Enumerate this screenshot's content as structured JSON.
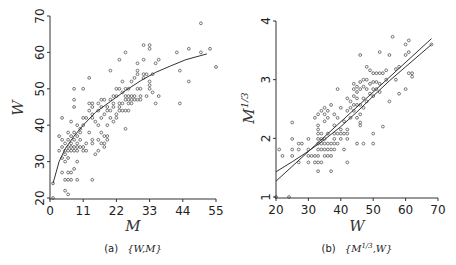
{
  "chart_data": [
    {
      "type": "scatter",
      "panel": "a",
      "caption": "(a) {W,M}",
      "caption_prefix": "(a)",
      "caption_math": "{W,M}",
      "xlabel": "M",
      "ylabel": "W",
      "xlim": [
        0,
        55
      ],
      "ylim": [
        20,
        70
      ],
      "xticks": [
        0,
        11,
        22,
        33,
        44,
        55
      ],
      "yticks": [
        20,
        30,
        40,
        50,
        60,
        70
      ],
      "grid": false,
      "fit_curve": {
        "type": "power",
        "description": "concave increasing fitted curve",
        "points": [
          [
            1,
            24
          ],
          [
            3,
            30
          ],
          [
            5,
            33.5
          ],
          [
            8,
            37
          ],
          [
            11,
            40
          ],
          [
            15,
            43.5
          ],
          [
            20,
            46.5
          ],
          [
            25,
            49.5
          ],
          [
            30,
            52.2
          ],
          [
            35,
            54.5
          ],
          [
            40,
            56.3
          ],
          [
            45,
            58
          ],
          [
            52,
            59.6
          ]
        ]
      },
      "points": [
        [
          1,
          20
        ],
        [
          1,
          24
        ],
        [
          3,
          37
        ],
        [
          3,
          33
        ],
        [
          4,
          42
        ],
        [
          4,
          36
        ],
        [
          4,
          34
        ],
        [
          4,
          31
        ],
        [
          4,
          27
        ],
        [
          5,
          35
        ],
        [
          5,
          33
        ],
        [
          5,
          32
        ],
        [
          5,
          30
        ],
        [
          5,
          25
        ],
        [
          5,
          22
        ],
        [
          6,
          38
        ],
        [
          6,
          36
        ],
        [
          6,
          34
        ],
        [
          6,
          33
        ],
        [
          6,
          31
        ],
        [
          6,
          27
        ],
        [
          6,
          25
        ],
        [
          6,
          21
        ],
        [
          7,
          41
        ],
        [
          7,
          37
        ],
        [
          7,
          35
        ],
        [
          7,
          34
        ],
        [
          7,
          33
        ],
        [
          7,
          27
        ],
        [
          7,
          25
        ],
        [
          8,
          50
        ],
        [
          8,
          47
        ],
        [
          8,
          45
        ],
        [
          8,
          38
        ],
        [
          8,
          36
        ],
        [
          8,
          34
        ],
        [
          8,
          33
        ],
        [
          8,
          28
        ],
        [
          9,
          40
        ],
        [
          9,
          37
        ],
        [
          9,
          35
        ],
        [
          9,
          34
        ],
        [
          9,
          33
        ],
        [
          9,
          30
        ],
        [
          9,
          25
        ],
        [
          10,
          39
        ],
        [
          10,
          38
        ],
        [
          10,
          36
        ],
        [
          10,
          34
        ],
        [
          11,
          50
        ],
        [
          11,
          42
        ],
        [
          11,
          40
        ],
        [
          11,
          34
        ],
        [
          11,
          33
        ],
        [
          12,
          42
        ],
        [
          12,
          35
        ],
        [
          12,
          33
        ],
        [
          13,
          53
        ],
        [
          13,
          46
        ],
        [
          13,
          44
        ],
        [
          13,
          38
        ],
        [
          14,
          46
        ],
        [
          14,
          45
        ],
        [
          14,
          43
        ],
        [
          14,
          42
        ],
        [
          14,
          36
        ],
        [
          14,
          35
        ],
        [
          14,
          25
        ],
        [
          15,
          41
        ],
        [
          15,
          32
        ],
        [
          16,
          46
        ],
        [
          16,
          44
        ],
        [
          16,
          40
        ],
        [
          16,
          36
        ],
        [
          16,
          33
        ],
        [
          17,
          47
        ],
        [
          17,
          45
        ],
        [
          17,
          42
        ],
        [
          17,
          38
        ],
        [
          17,
          35
        ],
        [
          18,
          47
        ],
        [
          18,
          43
        ],
        [
          18,
          37
        ],
        [
          18,
          35
        ],
        [
          18,
          34
        ],
        [
          19,
          45
        ],
        [
          19,
          44
        ],
        [
          19,
          40
        ],
        [
          19,
          37
        ],
        [
          19,
          36
        ],
        [
          20,
          55
        ],
        [
          20,
          47
        ],
        [
          20,
          44
        ],
        [
          20,
          42
        ],
        [
          21,
          48
        ],
        [
          21,
          46
        ],
        [
          21,
          45
        ],
        [
          21,
          41
        ],
        [
          22,
          50
        ],
        [
          22,
          48
        ],
        [
          22,
          43
        ],
        [
          22,
          42
        ],
        [
          23,
          58
        ],
        [
          23,
          50
        ],
        [
          23,
          46
        ],
        [
          23,
          45
        ],
        [
          23,
          44
        ],
        [
          24,
          52
        ],
        [
          24,
          49
        ],
        [
          24,
          46
        ],
        [
          24,
          44
        ],
        [
          25,
          60
        ],
        [
          25,
          50
        ],
        [
          25,
          48
        ],
        [
          25,
          47
        ],
        [
          25,
          44
        ],
        [
          25,
          39
        ],
        [
          26,
          50
        ],
        [
          26,
          48
        ],
        [
          26,
          47
        ],
        [
          26,
          46
        ],
        [
          26,
          44
        ],
        [
          27,
          52
        ],
        [
          27,
          48
        ],
        [
          27,
          47
        ],
        [
          27,
          46
        ],
        [
          28,
          53
        ],
        [
          28,
          48
        ],
        [
          28,
          47
        ],
        [
          29,
          57
        ],
        [
          29,
          55
        ],
        [
          29,
          54
        ],
        [
          29,
          50
        ],
        [
          29,
          47
        ],
        [
          30,
          50
        ],
        [
          30,
          48
        ],
        [
          30,
          47
        ],
        [
          31,
          62
        ],
        [
          31,
          58
        ],
        [
          31,
          54
        ],
        [
          31,
          53
        ],
        [
          32,
          54
        ],
        [
          32,
          48
        ],
        [
          33,
          62
        ],
        [
          33,
          61
        ],
        [
          33,
          52
        ],
        [
          33,
          51
        ],
        [
          33,
          50
        ],
        [
          34,
          54
        ],
        [
          34,
          49
        ],
        [
          35,
          57
        ],
        [
          35,
          46
        ],
        [
          36,
          58
        ],
        [
          36,
          48
        ],
        [
          42,
          60
        ],
        [
          43,
          55
        ],
        [
          43,
          46
        ],
        [
          46,
          61
        ],
        [
          46,
          52
        ],
        [
          50,
          68
        ],
        [
          50,
          60
        ],
        [
          53,
          61
        ],
        [
          55,
          56
        ]
      ]
    },
    {
      "type": "scatter",
      "panel": "b",
      "caption": "(b) {M^1/3,W}",
      "caption_prefix": "(b)",
      "caption_math": "{M",
      "caption_sup": "1/3",
      "caption_math2": ",W}",
      "xlabel": "W",
      "ylabel": "M",
      "ylabel_sup": "1/3",
      "xlim": [
        20,
        70
      ],
      "ylim": [
        1,
        4
      ],
      "xticks": [
        20,
        30,
        40,
        50,
        60,
        70
      ],
      "yticks": [
        1,
        2,
        3,
        4
      ],
      "grid": false,
      "fit_lines": [
        {
          "name": "linear fit",
          "points": [
            [
              20,
              1.27
            ],
            [
              68,
              3.7
            ]
          ]
        },
        {
          "name": "curved fit",
          "points": [
            [
              20,
              1.43
            ],
            [
              25,
              1.6
            ],
            [
              30,
              1.78
            ],
            [
              35,
              1.98
            ],
            [
              40,
              2.2
            ],
            [
              45,
              2.45
            ],
            [
              50,
              2.72
            ],
            [
              55,
              2.98
            ],
            [
              60,
              3.22
            ],
            [
              68,
              3.6
            ]
          ]
        }
      ],
      "points": [
        [
          20,
          1.0
        ],
        [
          24,
          1.0
        ],
        [
          21,
          1.81
        ],
        [
          22,
          1.7
        ],
        [
          25,
          2.27
        ],
        [
          25,
          1.99
        ],
        [
          25,
          1.81
        ],
        [
          25,
          1.7
        ],
        [
          27,
          1.91
        ],
        [
          27,
          1.81
        ],
        [
          27,
          1.59
        ],
        [
          28,
          1.91
        ],
        [
          30,
          1.99
        ],
        [
          30,
          1.81
        ],
        [
          30,
          1.7
        ],
        [
          30,
          1.59
        ],
        [
          31,
          1.7
        ],
        [
          32,
          2.35
        ],
        [
          32,
          1.7
        ],
        [
          32,
          1.59
        ],
        [
          33,
          2.41
        ],
        [
          33,
          2.22
        ],
        [
          33,
          2.15
        ],
        [
          33,
          2.08
        ],
        [
          33,
          1.99
        ],
        [
          33,
          1.91
        ],
        [
          33,
          1.81
        ],
        [
          33,
          1.7
        ],
        [
          33,
          1.59
        ],
        [
          33,
          1.44
        ],
        [
          34,
          2.47
        ],
        [
          34,
          2.08
        ],
        [
          34,
          1.99
        ],
        [
          34,
          1.91
        ],
        [
          34,
          1.81
        ],
        [
          34,
          1.59
        ],
        [
          35,
          2.52
        ],
        [
          35,
          2.41
        ],
        [
          35,
          2.29
        ],
        [
          35,
          1.99
        ],
        [
          35,
          1.91
        ],
        [
          35,
          1.81
        ],
        [
          35,
          1.7
        ],
        [
          36,
          2.47
        ],
        [
          36,
          2.35
        ],
        [
          36,
          2.08
        ],
        [
          36,
          1.91
        ],
        [
          36,
          1.81
        ],
        [
          36,
          1.7
        ],
        [
          37,
          2.57
        ],
        [
          37,
          1.91
        ],
        [
          37,
          1.81
        ],
        [
          37,
          1.7
        ],
        [
          37,
          1.44
        ],
        [
          38,
          2.41
        ],
        [
          38,
          2.22
        ],
        [
          38,
          2.08
        ],
        [
          38,
          1.99
        ],
        [
          38,
          1.91
        ],
        [
          38,
          1.81
        ],
        [
          39,
          2.84
        ],
        [
          39,
          2.35
        ],
        [
          39,
          2.08
        ],
        [
          39,
          1.91
        ],
        [
          40,
          2.52
        ],
        [
          40,
          2.15
        ],
        [
          40,
          2.08
        ],
        [
          40,
          1.99
        ],
        [
          41,
          2.29
        ],
        [
          41,
          2.08
        ],
        [
          41,
          1.81
        ],
        [
          42,
          2.68
        ],
        [
          42,
          2.47
        ],
        [
          42,
          2.15
        ],
        [
          42,
          2.08
        ],
        [
          42,
          1.99
        ],
        [
          42,
          1.59
        ],
        [
          43,
          2.63
        ],
        [
          43,
          2.52
        ],
        [
          43,
          2.35
        ],
        [
          44,
          2.93
        ],
        [
          44,
          2.84
        ],
        [
          44,
          2.72
        ],
        [
          44,
          2.57
        ],
        [
          44,
          2.47
        ],
        [
          45,
          2.88
        ],
        [
          45,
          2.79
        ],
        [
          45,
          2.68
        ],
        [
          45,
          2.57
        ],
        [
          45,
          2.35
        ],
        [
          45,
          1.91
        ],
        [
          46,
          3.42
        ],
        [
          46,
          2.96
        ],
        [
          46,
          2.84
        ],
        [
          46,
          2.57
        ],
        [
          46,
          2.41
        ],
        [
          46,
          2.27
        ],
        [
          46,
          2.22
        ],
        [
          47,
          3.0
        ],
        [
          47,
          2.88
        ],
        [
          47,
          2.68
        ],
        [
          47,
          2.52
        ],
        [
          47,
          1.91
        ],
        [
          48,
          3.22
        ],
        [
          48,
          3.0
        ],
        [
          48,
          2.84
        ],
        [
          48,
          2.63
        ],
        [
          49,
          3.16
        ],
        [
          49,
          2.93
        ],
        [
          49,
          2.76
        ],
        [
          50,
          3.11
        ],
        [
          50,
          2.96
        ],
        [
          50,
          2.84
        ],
        [
          50,
          2.72
        ],
        [
          50,
          2.08
        ],
        [
          50,
          1.91
        ],
        [
          51,
          3.11
        ],
        [
          51,
          2.96
        ],
        [
          51,
          2.84
        ],
        [
          52,
          3.47
        ],
        [
          52,
          3.11
        ],
        [
          52,
          2.93
        ],
        [
          52,
          2.79
        ],
        [
          53,
          3.11
        ],
        [
          53,
          2.2
        ],
        [
          54,
          3.16
        ],
        [
          54,
          3.0
        ],
        [
          55,
          3.42
        ],
        [
          55,
          2.63
        ],
        [
          56,
          3.73
        ],
        [
          57,
          3.18
        ],
        [
          57,
          3.0
        ],
        [
          58,
          3.22
        ],
        [
          58,
          2.76
        ],
        [
          60,
          3.6
        ],
        [
          60,
          3.42
        ],
        [
          60,
          2.84
        ],
        [
          61,
          3.67
        ],
        [
          61,
          3.47
        ],
        [
          61,
          3.11
        ],
        [
          62,
          3.11
        ],
        [
          62,
          3.05
        ],
        [
          68,
          3.6
        ]
      ]
    }
  ]
}
